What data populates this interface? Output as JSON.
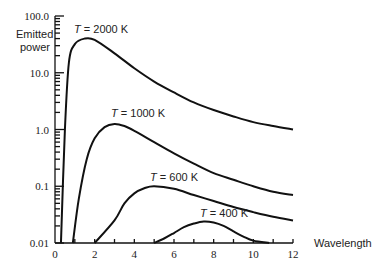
{
  "chart_data": {
    "type": "line",
    "title": "",
    "xlabel": "Wavelength",
    "ylabel": "Emitted power",
    "yscale": "log",
    "xlim": [
      0,
      12
    ],
    "ylim": [
      0.01,
      100.0
    ],
    "x_ticks": [
      "0",
      "2",
      "4",
      "6",
      "8",
      "10",
      "12"
    ],
    "y_ticks": [
      "0.01",
      "0.1",
      "1.0",
      "10.0",
      "100.0"
    ],
    "grid": false,
    "legend": "inline labels",
    "series": [
      {
        "name": "T = 2000 K",
        "label": "T = 2000 K",
        "x": [
          0.3,
          0.5,
          0.7,
          1.0,
          1.5,
          2,
          3,
          4,
          5,
          6,
          7,
          8,
          9,
          10,
          11,
          12
        ],
        "y": [
          0.01,
          1.0,
          15,
          32,
          40,
          38,
          22,
          12,
          7,
          4.5,
          3.0,
          2.2,
          1.7,
          1.35,
          1.15,
          1.0
        ]
      },
      {
        "name": "T = 1000 K",
        "label": "T = 1000 K",
        "x": [
          0.9,
          1.2,
          1.6,
          2,
          2.5,
          3,
          3.5,
          4,
          5,
          6,
          7,
          8,
          9,
          10,
          11,
          12
        ],
        "y": [
          0.01,
          0.06,
          0.3,
          0.7,
          1.1,
          1.25,
          1.15,
          0.95,
          0.6,
          0.38,
          0.25,
          0.17,
          0.13,
          0.1,
          0.08,
          0.07
        ]
      },
      {
        "name": "T = 600 K",
        "label": "T = 600 K",
        "x": [
          2,
          3,
          3.5,
          4,
          4.5,
          5,
          6,
          7,
          8,
          9,
          10,
          11,
          12
        ],
        "y": [
          0.01,
          0.025,
          0.05,
          0.075,
          0.092,
          0.1,
          0.09,
          0.07,
          0.055,
          0.043,
          0.035,
          0.029,
          0.025
        ]
      },
      {
        "name": "T = 400 K",
        "label": "T = 400 K",
        "x": [
          5,
          5.5,
          6,
          6.5,
          7,
          7.5,
          8,
          8.5,
          9,
          9.5,
          10,
          10.8
        ],
        "y": [
          0.01,
          0.012,
          0.015,
          0.019,
          0.022,
          0.024,
          0.023,
          0.02,
          0.016,
          0.013,
          0.011,
          0.01
        ]
      }
    ]
  }
}
